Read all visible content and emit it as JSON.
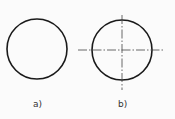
{
  "figures": [
    {
      "id": "a",
      "label": "a)",
      "center": [
        37,
        49
      ],
      "radius": 30,
      "center_lines": false
    },
    {
      "id": "b",
      "label": "b)",
      "center": [
        122,
        50
      ],
      "radius": 30,
      "center_lines": true
    }
  ],
  "colors": {
    "stroke": "#1a1a1a",
    "center_line": "#444444",
    "background": "#fbfbfb"
  }
}
